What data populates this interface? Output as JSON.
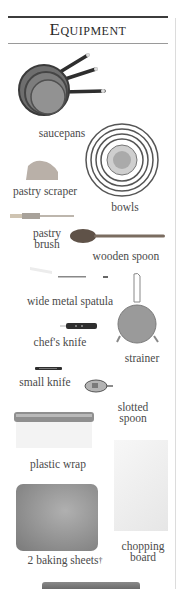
{
  "page": {
    "title": "Equipment"
  },
  "items": [
    {
      "id": "saucepans",
      "label": "saucepans"
    },
    {
      "id": "pastry-scraper",
      "label": "pastry scraper"
    },
    {
      "id": "bowls",
      "label": "bowls"
    },
    {
      "id": "pastry-brush",
      "label_lines": [
        "pastry",
        "brush"
      ]
    },
    {
      "id": "wooden-spoon",
      "label": "wooden spoon"
    },
    {
      "id": "wide-metal-spatula",
      "label": "wide metal spatula"
    },
    {
      "id": "chefs-knife",
      "label": "chef's knife"
    },
    {
      "id": "strainer",
      "label": "strainer"
    },
    {
      "id": "small-knife",
      "label": "small knife"
    },
    {
      "id": "slotted-spoon",
      "label_lines": [
        "slotted",
        "spoon"
      ]
    },
    {
      "id": "plastic-wrap",
      "label": "plastic wrap"
    },
    {
      "id": "baking-sheets",
      "label": "2 baking sheets",
      "footnote_mark": "†"
    },
    {
      "id": "chopping-board",
      "label_lines": [
        "chopping",
        "board"
      ]
    }
  ],
  "colors": {
    "rule": "#3c3c3c",
    "text": "#4a4a4a",
    "metal": "#8a8a8a",
    "wood": "#6b5a48"
  }
}
